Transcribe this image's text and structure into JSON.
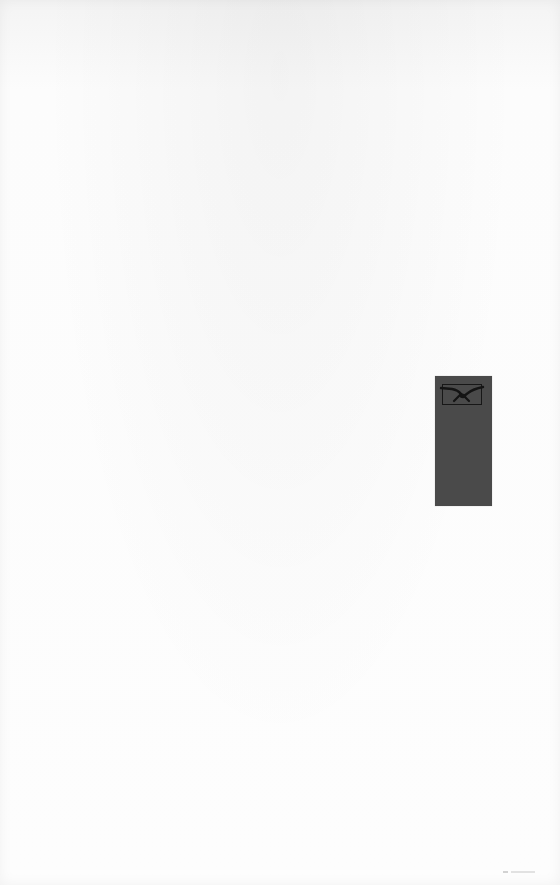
{
  "page": {
    "background_color": "#fbfbfb"
  },
  "tab_marker": {
    "color": "#4a4a4a",
    "emblem": {
      "icon": "winged-emblem-icon",
      "border_color": "#171717"
    }
  },
  "footer_mark": {
    "color": "#e2e2e2"
  }
}
